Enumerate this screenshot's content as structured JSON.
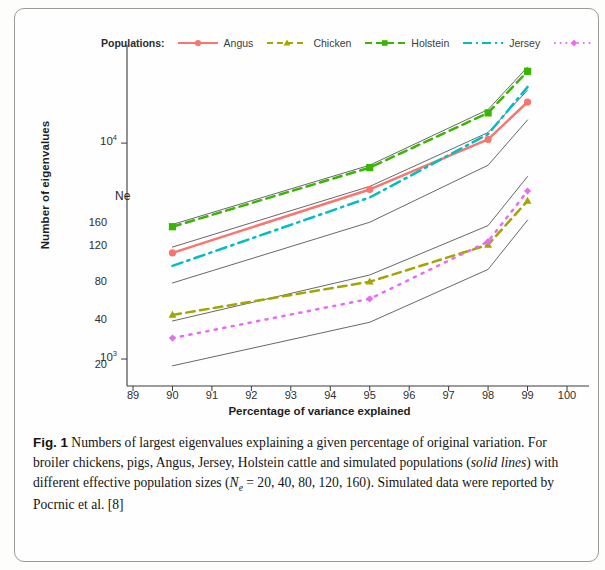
{
  "figure": {
    "caption_label": "Fig. 1",
    "caption_part1": " Numbers of largest eigenvalues explaining a given percentage of original variation. For broiler chickens, pigs, Angus, Jersey, Holstein cattle and simulated populations (",
    "caption_italic1": "solid lines",
    "caption_part2": ") with different effective population sizes (",
    "caption_ne_symbol": "N",
    "caption_ne_sub": "e",
    "caption_part3": " = 20, 40, 80, 120, 160). Simulated data were reported by Pocrnic et al. [8]"
  },
  "legend": {
    "title": "Populations:",
    "entries": [
      {
        "label": "Angus",
        "color": "#F8766D",
        "dash": "solid",
        "marker": "circle"
      },
      {
        "label": "Chicken",
        "color": "#A3A500",
        "dash": "dashed",
        "marker": "triangle"
      },
      {
        "label": "Holstein",
        "color": "#39B600",
        "dash": "dashed",
        "marker": "square"
      },
      {
        "label": "Jersey",
        "color": "#00BFC4",
        "dash": "dashdot",
        "marker": "none"
      },
      {
        "label": "Pigs",
        "color": "#E76BF3",
        "dash": "dotted",
        "marker": "diamond"
      }
    ]
  },
  "ne_annotation": {
    "heading": "Ne",
    "labels": [
      "160",
      "120",
      "80",
      "40",
      "20"
    ]
  },
  "chart_data": {
    "type": "line",
    "title": "",
    "xlabel": "Percentage of variance explained",
    "ylabel": "Number of eigenvalues",
    "xlim": [
      89,
      100
    ],
    "ylim": [
      750,
      24000
    ],
    "yscale": "log",
    "xticks": [
      89,
      90,
      91,
      92,
      93,
      94,
      95,
      96,
      97,
      98,
      99,
      100
    ],
    "yticks": [
      1000,
      10000
    ],
    "ytick_labels": [
      "10³",
      "10⁴"
    ],
    "grid": false,
    "legend_position": "top",
    "x": [
      90,
      95,
      98,
      99
    ],
    "series": [
      {
        "name": "Angus",
        "color": "#F8766D",
        "dash": "solid",
        "marker": "circle",
        "values": [
          3100,
          6100,
          10400,
          15500
        ]
      },
      {
        "name": "Chicken",
        "color": "#A3A500",
        "dash": "dashed",
        "marker": "triangle",
        "values": [
          1600,
          2280,
          3380,
          5400
        ]
      },
      {
        "name": "Holstein",
        "color": "#39B600",
        "dash": "dashed",
        "marker": "square",
        "values": [
          4100,
          7700,
          13800,
          21500
        ]
      },
      {
        "name": "Jersey",
        "color": "#00BFC4",
        "dash": "dashdot",
        "marker": "none",
        "values": [
          2700,
          5600,
          11000,
          18200
        ]
      },
      {
        "name": "Pigs",
        "color": "#E76BF3",
        "dash": "dotted",
        "marker": "diamond",
        "values": [
          1250,
          1900,
          3500,
          6000
        ]
      }
    ],
    "simulated_lines": [
      {
        "name": "Ne = 160",
        "color": "#4d4d4d",
        "dash": "solid",
        "x": [
          90,
          95,
          98,
          99
        ],
        "values": [
          4200,
          7900,
          14300,
          22500
        ]
      },
      {
        "name": "Ne = 120",
        "color": "#4d4d4d",
        "dash": "solid",
        "x": [
          90,
          95,
          98,
          99
        ],
        "values": [
          3300,
          6300,
          11200,
          17600
        ]
      },
      {
        "name": "Ne = 80",
        "color": "#4d4d4d",
        "dash": "solid",
        "x": [
          90,
          95,
          98,
          99
        ],
        "values": [
          2250,
          4300,
          7900,
          12800
        ]
      },
      {
        "name": "Ne = 40",
        "color": "#4d4d4d",
        "dash": "solid",
        "x": [
          90,
          95,
          98,
          99
        ],
        "values": [
          1500,
          2450,
          4150,
          7000
        ]
      },
      {
        "name": "Ne = 20",
        "color": "#4d4d4d",
        "dash": "solid",
        "x": [
          90,
          95,
          98,
          99
        ],
        "values": [
          930,
          1480,
          2600,
          4400
        ]
      }
    ]
  }
}
